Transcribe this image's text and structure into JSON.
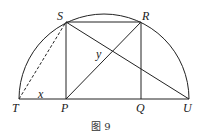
{
  "figure": {
    "caption": "图 9",
    "shape": "semicircle with inscribed rectangle PQRS",
    "points": {
      "T": {
        "label": "T",
        "x": 19,
        "y": 99
      },
      "P": {
        "label": "P",
        "x": 66,
        "y": 99
      },
      "Q": {
        "label": "Q",
        "x": 141,
        "y": 99
      },
      "U": {
        "label": "U",
        "x": 189,
        "y": 99
      },
      "S": {
        "label": "S",
        "x": 66,
        "y": 22
      },
      "R": {
        "label": "R",
        "x": 141,
        "y": 22
      }
    },
    "angle_labels": {
      "x": "x",
      "y": "y"
    },
    "segments": {
      "solid": [
        "TU",
        "SP",
        "RQ",
        "SR",
        "PR",
        "SU"
      ],
      "dashed": [
        "TS"
      ]
    },
    "colors": {
      "stroke": "#222222"
    }
  }
}
